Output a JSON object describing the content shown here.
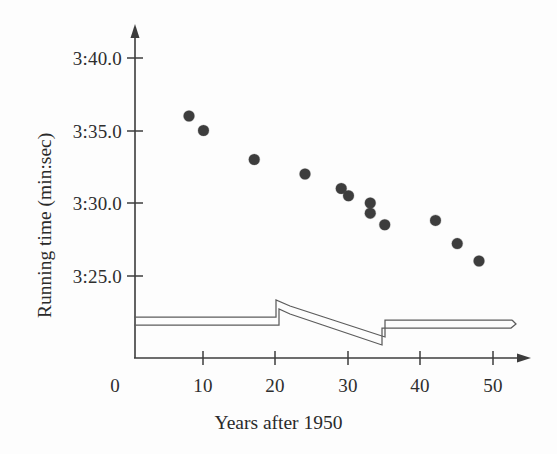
{
  "chart_data": {
    "type": "scatter",
    "title": "",
    "xlabel": "Years after 1950",
    "ylabel": "Running time (min:sec)",
    "x_tick_labels": [
      "0",
      "10",
      "20",
      "30",
      "40",
      "50"
    ],
    "x_tick_values": [
      0,
      10,
      20,
      30,
      40,
      50
    ],
    "y_tick_labels": [
      "3:40.0",
      "3:35.0",
      "3:30.0",
      "3:25.0"
    ],
    "y_tick_values": [
      220.0,
      215.0,
      210.0,
      205.0
    ],
    "y_tick_unit": "seconds",
    "xlim": [
      0,
      53
    ],
    "ylim": [
      202.0,
      222.0
    ],
    "grid": false,
    "legend": null,
    "marker": "filled-circle",
    "marker_color": "#3d3d3d",
    "marker_size_px": 11,
    "points": [
      {
        "x": 8,
        "y": 216.0,
        "label": "3:36.0"
      },
      {
        "x": 10,
        "y": 215.0,
        "label": "3:35.0"
      },
      {
        "x": 17,
        "y": 213.0,
        "label": "3:33.0"
      },
      {
        "x": 24,
        "y": 212.0,
        "label": "3:32.0"
      },
      {
        "x": 29,
        "y": 211.0,
        "label": "3:31.0"
      },
      {
        "x": 30,
        "y": 210.5,
        "label": "3:30.5"
      },
      {
        "x": 33,
        "y": 210.0,
        "label": "3:30.0"
      },
      {
        "x": 33,
        "y": 209.3,
        "label": "3:29.3"
      },
      {
        "x": 35,
        "y": 208.5,
        "label": "3:28.5"
      },
      {
        "x": 42,
        "y": 208.8,
        "label": "3:28.8"
      },
      {
        "x": 45,
        "y": 207.2,
        "label": "3:27.2"
      },
      {
        "x": 48,
        "y": 206.0,
        "label": "3:26.0"
      }
    ],
    "annotations": [
      {
        "name": "scan-artifact-ribbon",
        "description": "thin double-line band crossing the lower plot area (page-fold scanning artifact)",
        "color": "#5c5c5c"
      }
    ]
  },
  "axes": {
    "y_arrow": true,
    "x_arrow": true,
    "axis_color": "#3c3c3c"
  }
}
